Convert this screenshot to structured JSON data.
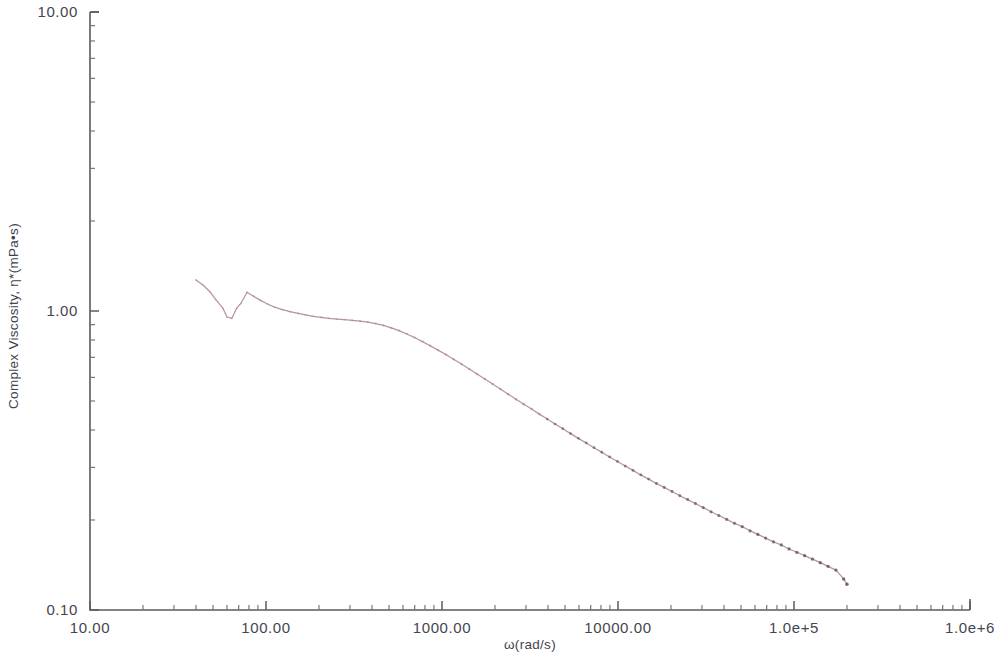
{
  "chart_data": {
    "type": "line",
    "title": "",
    "subtitle": "",
    "xlabel": "ω(rad/s)",
    "ylabel": "Complex Viscosity, η*(mPa•s)",
    "xscale": "log",
    "yscale": "log",
    "xlim": [
      10,
      1000000
    ],
    "ylim": [
      0.1,
      10
    ],
    "grid": false,
    "legend": null,
    "legend_position": "none",
    "xtick_labels": [
      "10.00",
      "100.00",
      "1000.00",
      "10000.00",
      "1.0e+5",
      "1.0e+6"
    ],
    "xtick_values": [
      10,
      100,
      1000,
      10000,
      100000,
      1000000
    ],
    "ytick_labels": [
      "10.00",
      "1.00",
      "0.10"
    ],
    "ytick_values": [
      10,
      1,
      0.1
    ],
    "series": [
      {
        "name": "Complex Viscosity",
        "color": "#b08a95",
        "marker": "dot",
        "x": [
          40,
          44,
          48,
          52,
          57,
          60,
          64,
          68,
          72,
          78,
          85,
          93,
          102,
          112,
          124,
          137,
          152,
          168,
          186,
          206,
          228,
          252,
          279,
          309,
          342,
          379,
          420,
          465,
          515,
          570,
          631,
          699,
          774,
          857,
          949,
          1051,
          1164,
          1289,
          1428,
          1581,
          1751,
          1939,
          2147,
          2378,
          2633,
          2916,
          3229,
          3576,
          3960,
          4385,
          4857,
          5379,
          5957,
          6597,
          7306,
          8091,
          8960,
          9923,
          10990,
          12170,
          13480,
          14930,
          16530,
          18310,
          20280,
          22460,
          24870,
          27550,
          30510,
          33790,
          37420,
          41440,
          45890,
          50820,
          56280,
          62330,
          69030,
          76450,
          84670,
          93770,
          103800,
          115000,
          127300,
          141000,
          156200,
          173000,
          191600,
          200000
        ],
        "y": [
          1.27,
          1.22,
          1.16,
          1.09,
          1.02,
          0.955,
          0.945,
          1.02,
          1.06,
          1.155,
          1.12,
          1.085,
          1.055,
          1.03,
          1.01,
          0.995,
          0.982,
          0.97,
          0.96,
          0.952,
          0.945,
          0.94,
          0.935,
          0.93,
          0.925,
          0.918,
          0.908,
          0.895,
          0.878,
          0.86,
          0.838,
          0.815,
          0.79,
          0.765,
          0.74,
          0.715,
          0.69,
          0.665,
          0.64,
          0.616,
          0.592,
          0.57,
          0.548,
          0.527,
          0.507,
          0.488,
          0.47,
          0.452,
          0.435,
          0.419,
          0.404,
          0.389,
          0.375,
          0.362,
          0.349,
          0.337,
          0.325,
          0.314,
          0.303,
          0.293,
          0.283,
          0.274,
          0.265,
          0.257,
          0.249,
          0.241,
          0.234,
          0.227,
          0.22,
          0.213,
          0.207,
          0.201,
          0.195,
          0.19,
          0.184,
          0.179,
          0.174,
          0.169,
          0.165,
          0.16,
          0.156,
          0.152,
          0.148,
          0.144,
          0.14,
          0.136,
          0.127,
          0.122
        ]
      }
    ],
    "annotations": []
  },
  "axes": {
    "x_title": "ω(rad/s)",
    "y_title": "Complex Viscosity, η*(mPa•s)",
    "x_labels": [
      "10.00",
      "100.00",
      "1000.00",
      "10000.00",
      "1.0e+5",
      "1.0e+6"
    ],
    "y_labels": [
      "10.00",
      "1.00",
      "0.10"
    ],
    "axis_color": "#5a5a63"
  },
  "style": {
    "background": "#ffffff",
    "series_color": "#b08a95",
    "text_color": "#45454f"
  }
}
